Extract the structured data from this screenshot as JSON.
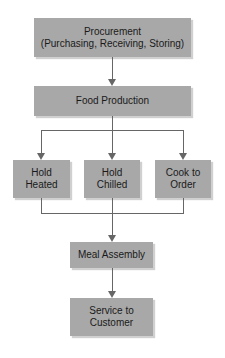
{
  "diagram": {
    "type": "flowchart",
    "nodes": {
      "procurement": {
        "label": "Procurement\n(Purchasing, Receiving, Storing)"
      },
      "food_production": {
        "label": "Food Production"
      },
      "hold_heated": {
        "label": "Hold\nHeated"
      },
      "hold_chilled": {
        "label": "Hold\nChilled"
      },
      "cook_to_order": {
        "label": "Cook to\nOrder"
      },
      "meal_assembly": {
        "label": "Meal Assembly"
      },
      "service": {
        "label": "Service to\nCustomer"
      }
    },
    "edges": [
      [
        "procurement",
        "food_production"
      ],
      [
        "food_production",
        "hold_heated"
      ],
      [
        "food_production",
        "hold_chilled"
      ],
      [
        "food_production",
        "cook_to_order"
      ],
      [
        "hold_heated",
        "meal_assembly"
      ],
      [
        "hold_chilled",
        "meal_assembly"
      ],
      [
        "cook_to_order",
        "meal_assembly"
      ],
      [
        "meal_assembly",
        "service"
      ]
    ],
    "colors": {
      "box_fill": "#a8a8a8",
      "line": "#666666",
      "text": "#1a1a1a"
    }
  }
}
